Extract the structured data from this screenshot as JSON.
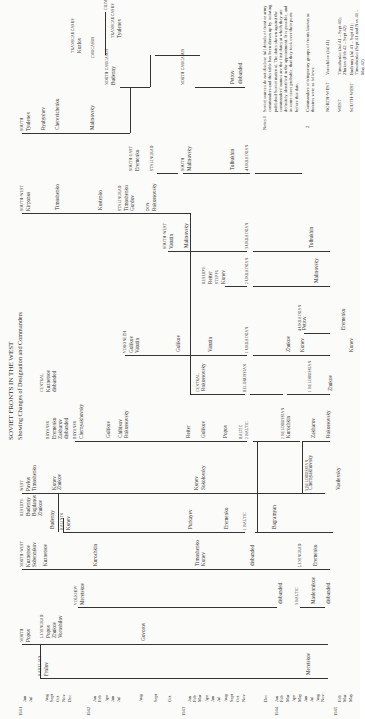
{
  "title": {
    "main": "SOVIET FRONTS IN THE WEST",
    "subtitle": "Showing Changes of Designation and Commanders"
  },
  "axis": {
    "years": [
      {
        "label": "1941",
        "x": 22
      },
      {
        "label": "1942",
        "x": 90
      },
      {
        "label": "1943",
        "x": 185
      },
      {
        "label": "1944",
        "x": 278
      },
      {
        "label": "1945",
        "x": 337
      }
    ],
    "months": [
      {
        "label": "Jun",
        "x": 25
      },
      {
        "label": "Jul",
        "x": 31
      },
      {
        "label": "Aug",
        "x": 47
      },
      {
        "label": "Sept",
        "x": 52
      },
      {
        "label": "Oct",
        "x": 58
      },
      {
        "label": "Nov",
        "x": 64
      },
      {
        "label": "Dec",
        "x": 70
      },
      {
        "label": "Jan",
        "x": 95
      },
      {
        "label": "Feb",
        "x": 100
      },
      {
        "label": "Apr",
        "x": 107
      },
      {
        "label": "Jun",
        "x": 113
      },
      {
        "label": "Jul",
        "x": 119
      },
      {
        "label": "Aug",
        "x": 141
      },
      {
        "label": "Sept",
        "x": 156
      },
      {
        "label": "Oct",
        "x": 170
      },
      {
        "label": "Jan",
        "x": 190
      },
      {
        "label": "Feb",
        "x": 195
      },
      {
        "label": "Mar",
        "x": 200
      },
      {
        "label": "Apr",
        "x": 207
      },
      {
        "label": "Jun",
        "x": 213
      },
      {
        "label": "Jul",
        "x": 219
      },
      {
        "label": "Aug",
        "x": 226
      },
      {
        "label": "Sept",
        "x": 232
      },
      {
        "label": "Oct",
        "x": 238
      },
      {
        "label": "Nov",
        "x": 244
      },
      {
        "label": "Dec",
        "x": 266
      },
      {
        "label": "Jan",
        "x": 277
      },
      {
        "label": "Feb",
        "x": 282
      },
      {
        "label": "Mar",
        "x": 288
      },
      {
        "label": "Apr",
        "x": 294
      },
      {
        "label": "May",
        "x": 300
      },
      {
        "label": "Jun",
        "x": 306
      },
      {
        "label": "Jul",
        "x": 312
      },
      {
        "label": "Aug",
        "x": 318
      },
      {
        "label": "Nov",
        "x": 323
      },
      {
        "label": "Feb",
        "x": 340
      },
      {
        "label": "Mar",
        "x": 345
      },
      {
        "label": "May",
        "x": 351
      }
    ]
  },
  "fronts": [
    {
      "name": "NORTH",
      "x": 22,
      "y": 644,
      "commanders": [
        "Popov"
      ]
    },
    {
      "name": "KARELIAN",
      "x": 40,
      "y": 678,
      "commanders": [
        "Frolov"
      ]
    },
    {
      "name": "LENINGRAD",
      "x": 42,
      "y": 640,
      "commanders": [
        "Popov",
        "Zhukov",
        "Voroshilov"
      ]
    },
    {
      "name": "VOLKHOV",
      "x": 76,
      "y": 607,
      "commanders": [
        "Meretskov"
      ]
    },
    {
      "name": "NORTH-WEST",
      "x": 22,
      "y": 569,
      "commanders": [
        "Kuznetsov",
        "Sobennikov"
      ]
    },
    {
      "name": "RESERVE",
      "x": 22,
      "y": 518,
      "commanders": [
        "Budenny",
        "Bogdanov",
        "Zhukov"
      ]
    },
    {
      "name": "KALININ",
      "x": 62,
      "y": 532,
      "commanders": [
        "Konev"
      ]
    },
    {
      "name": "WEST",
      "x": 22,
      "y": 493,
      "commanders": [
        "Pavlov",
        "Timoshenko"
      ]
    },
    {
      "name": "BRYANSK",
      "x": 48,
      "y": 441,
      "commanders": [
        "Eremenko",
        "Zakharov",
        "disbanded"
      ]
    },
    {
      "name": "BRYANSK",
      "x": 75,
      "y": 441,
      "commanders": [
        "Chernyakhovsky"
      ]
    },
    {
      "name": "CENTRAL",
      "x": 42,
      "y": 394,
      "commanders": [
        "Kuznetsov",
        "disbanded"
      ]
    },
    {
      "name": "VORONEZH",
      "x": 125,
      "y": 355,
      "commanders": [
        "Golikov",
        "Vatutin"
      ]
    },
    {
      "name": "SOUTH-WEST",
      "x": 22,
      "y": 213,
      "commanders": [
        "Kirponos"
      ]
    },
    {
      "name": "STALINGRAD",
      "x": 120,
      "y": 213,
      "commanders": [
        "Timoshenko",
        "Gordov"
      ]
    },
    {
      "name": "DON",
      "x": 148,
      "y": 213,
      "commanders": [
        "Rokossovsky"
      ]
    },
    {
      "name": "SOUTH-WEST",
      "x": 165,
      "y": 251,
      "commanders": [
        "Vatutin"
      ]
    },
    {
      "name": "RESERVE",
      "x": 204,
      "y": 286,
      "commanders": [
        "Reiter"
      ]
    },
    {
      "name": "STEPPE",
      "x": 217,
      "y": 286,
      "commanders": [
        "Konev"
      ]
    },
    {
      "name": "SOUTH",
      "x": 22,
      "y": 133,
      "commanders": [
        "Tyulenev"
      ]
    },
    {
      "name": "SOUTH-EAST",
      "x": 131,
      "y": 173,
      "commanders": [
        "Eremenko"
      ]
    },
    {
      "name": "STALINGRAD",
      "x": 152,
      "y": 173,
      "commanders": []
    },
    {
      "name": "SOUTH",
      "x": 183,
      "y": 173,
      "commanders": [
        "Malinovsky"
      ]
    },
    {
      "name": "NORTH CAUCASUS",
      "x": 107,
      "y": 87,
      "commanders": [
        "Budenny"
      ]
    },
    {
      "name": "TRANSCAUCASUS",
      "x": 73,
      "y": 55,
      "commanders": [
        "Kozlov"
      ]
    },
    {
      "name": "CAUCASUS",
      "x": 93,
      "y": 60,
      "commanders": []
    },
    {
      "name": "TRANSCAUCASUS",
      "x": 113,
      "y": 40,
      "commanders": [
        "Tyulenev"
      ]
    },
    {
      "name": "CRIMEA",
      "x": 106,
      "y": 12,
      "commanders": []
    },
    {
      "name": "NORTH CAUCASUS",
      "x": 183,
      "y": 87,
      "commanders": []
    }
  ],
  "later_fronts": [
    {
      "name": "BALTIC",
      "x": 241,
      "y": 441
    },
    {
      "name": "2 BALTIC",
      "x": 247,
      "y": 441
    },
    {
      "name": "1 BALTIC",
      "x": 245,
      "y": 532
    },
    {
      "name": "3 BALTIC",
      "x": 297,
      "y": 607
    },
    {
      "name": "2 BELORUSSIAN",
      "x": 283,
      "y": 441
    },
    {
      "name": "3 BELORUSSIAN",
      "x": 307,
      "y": 493
    },
    {
      "name": "1 BELORUSSIAN",
      "x": 310,
      "y": 394
    },
    {
      "name": "BELORUSSIAN",
      "x": 245,
      "y": 394
    },
    {
      "name": "1 UKRAINIAN",
      "x": 247,
      "y": 355
    },
    {
      "name": "2 UKRAINIAN",
      "x": 247,
      "y": 286
    },
    {
      "name": "3 UKRAINIAN",
      "x": 247,
      "y": 251
    },
    {
      "name": "4 UKRAINIAN",
      "x": 247,
      "y": 173
    },
    {
      "name": "4 UKRAINIAN",
      "x": 300,
      "y": 333
    },
    {
      "name": "LENINGRAD",
      "x": 300,
      "y": 569
    },
    {
      "name": "CENTRAL",
      "x": 198,
      "y": 394
    }
  ],
  "commander_labels": [
    {
      "text": "Kuznetsov",
      "x": 45,
      "y": 569
    },
    {
      "text": "Kurochkin",
      "x": 95,
      "y": 569
    },
    {
      "text": "Timoshenko",
      "x": 197,
      "y": 569
    },
    {
      "text": "Konev",
      "x": 203,
      "y": 569
    },
    {
      "text": "disbanded",
      "x": 252,
      "y": 569
    },
    {
      "text": "Eremenko",
      "x": 315,
      "y": 569
    },
    {
      "text": "disbanded",
      "x": 280,
      "y": 607
    },
    {
      "text": "Maslennikov",
      "x": 313,
      "y": 607
    },
    {
      "text": "disbanded",
      "x": 328,
      "y": 607
    },
    {
      "text": "Govorov",
      "x": 143,
      "y": 644
    },
    {
      "text": "Meretskov",
      "x": 308,
      "y": 678
    },
    {
      "text": "Budenny",
      "x": 52,
      "y": 532
    },
    {
      "text": "Purkayev",
      "x": 190,
      "y": 532
    },
    {
      "text": "Eremenko",
      "x": 226,
      "y": 532
    },
    {
      "text": "Bagramyan",
      "x": 274,
      "y": 532
    },
    {
      "text": "Konev",
      "x": 54,
      "y": 493
    },
    {
      "text": "Zhukov",
      "x": 59,
      "y": 493
    },
    {
      "text": "Konev",
      "x": 196,
      "y": 493
    },
    {
      "text": "Sokolovsky",
      "x": 203,
      "y": 493
    },
    {
      "text": "Chernyakhovsky",
      "x": 310,
      "y": 493
    },
    {
      "text": "Vasilevsky",
      "x": 338,
      "y": 493
    },
    {
      "text": "Golikov",
      "x": 108,
      "y": 441
    },
    {
      "text": "Chibisov",
      "x": 120,
      "y": 441
    },
    {
      "text": "Rokossovsky",
      "x": 126,
      "y": 441
    },
    {
      "text": "Reiter",
      "x": 188,
      "y": 441
    },
    {
      "text": "Golikov",
      "x": 203,
      "y": 441
    },
    {
      "text": "Popov",
      "x": 225,
      "y": 441
    },
    {
      "text": "Kurochkin",
      "x": 288,
      "y": 441
    },
    {
      "text": "Zakharov",
      "x": 313,
      "y": 441
    },
    {
      "text": "Rokossovsky",
      "x": 328,
      "y": 441
    },
    {
      "text": "Rokossovsky",
      "x": 203,
      "y": 394
    },
    {
      "text": "Zhukov",
      "x": 330,
      "y": 394
    },
    {
      "text": "Golikov",
      "x": 178,
      "y": 355
    },
    {
      "text": "Vatutin",
      "x": 210,
      "y": 355
    },
    {
      "text": "Zhukov",
      "x": 288,
      "y": 355
    },
    {
      "text": "Konev",
      "x": 302,
      "y": 355
    },
    {
      "text": "Konev",
      "x": 351,
      "y": 355
    },
    {
      "text": "Petrov",
      "x": 304,
      "y": 333
    },
    {
      "text": "Eremenko",
      "x": 343,
      "y": 333
    },
    {
      "text": "Malinovsky",
      "x": 316,
      "y": 286
    },
    {
      "text": "Malinovsky",
      "x": 186,
      "y": 251
    },
    {
      "text": "Tolbukhin",
      "x": 311,
      "y": 251
    },
    {
      "text": "Timoshenko",
      "x": 57,
      "y": 213
    },
    {
      "text": "Kostenko",
      "x": 100,
      "y": 213
    },
    {
      "text": "Ryabyshev",
      "x": 43,
      "y": 133
    },
    {
      "text": "Cherevichenko",
      "x": 57,
      "y": 133
    },
    {
      "text": "Malinovsky",
      "x": 92,
      "y": 133
    },
    {
      "text": "Tolbukhin",
      "x": 232,
      "y": 173
    },
    {
      "text": "Petrov",
      "x": 232,
      "y": 87
    },
    {
      "text": "disbanded",
      "x": 240,
      "y": 87
    }
  ],
  "lines": [
    {
      "x1": 22,
      "x2": 330,
      "y": 569
    },
    {
      "x1": 78,
      "x2": 277,
      "y": 607
    },
    {
      "x1": 300,
      "x2": 325,
      "y": 607
    },
    {
      "x1": 22,
      "x2": 328,
      "y": 644
    },
    {
      "x1": 40,
      "x2": 328,
      "y": 678
    },
    {
      "x1": 63,
      "x2": 245,
      "y": 532
    },
    {
      "x1": 255,
      "x2": 333,
      "y": 532
    },
    {
      "x1": 22,
      "x2": 325,
      "y": 493
    },
    {
      "x1": 75,
      "x2": 247,
      "y": 441
    },
    {
      "x1": 253,
      "x2": 300,
      "y": 441
    },
    {
      "x1": 303,
      "x2": 330,
      "y": 441
    },
    {
      "x1": 190,
      "x2": 245,
      "y": 394
    },
    {
      "x1": 250,
      "x2": 283,
      "y": 394
    },
    {
      "x1": 287,
      "x2": 330,
      "y": 394
    },
    {
      "x1": 125,
      "x2": 247,
      "y": 355
    },
    {
      "x1": 253,
      "x2": 330,
      "y": 355
    },
    {
      "x1": 304,
      "x2": 330,
      "y": 333
    },
    {
      "x1": 225,
      "x2": 247,
      "y": 286
    },
    {
      "x1": 253,
      "x2": 330,
      "y": 286
    },
    {
      "x1": 168,
      "x2": 247,
      "y": 251
    },
    {
      "x1": 253,
      "x2": 330,
      "y": 251
    },
    {
      "x1": 22,
      "x2": 190,
      "y": 213
    },
    {
      "x1": 22,
      "x2": 130,
      "y": 133
    },
    {
      "x1": 120,
      "x2": 150,
      "y": 87
    },
    {
      "x1": 155,
      "x2": 185,
      "y": 55
    },
    {
      "x1": 155,
      "x2": 200,
      "y": 55
    },
    {
      "x1": 195,
      "x2": 245,
      "y": 87
    },
    {
      "x1": 157,
      "x2": 178,
      "y": 173
    },
    {
      "x1": 183,
      "x2": 250,
      "y": 173
    },
    {
      "x1": 255,
      "x2": 302,
      "y": 173
    }
  ],
  "vlines": [
    {
      "x": 40,
      "y1": 644,
      "y2": 678
    },
    {
      "x": 58,
      "y1": 493,
      "y2": 532
    },
    {
      "x": 63,
      "y1": 518,
      "y2": 532
    },
    {
      "x": 190,
      "y1": 213,
      "y2": 394
    },
    {
      "x": 257,
      "y1": 441,
      "y2": 532
    },
    {
      "x": 130,
      "y1": 87,
      "y2": 133
    },
    {
      "x": 150,
      "y1": 55,
      "y2": 87
    },
    {
      "x": 302,
      "y1": 441,
      "y2": 493
    },
    {
      "x": 105,
      "y1": 12,
      "y2": 55
    }
  ],
  "notes": {
    "label": "Notes 1",
    "paragraph": "Soviet sources do not disclose full details of front or army commanders and this table has been drawn up by isolating published Soviet material. The dates shown against the commanders' names are the first dates at which they are definitely identified in the appointment. It is possible, and in some cases probable, that they took over their posts before this date.",
    "item2_label": "2",
    "item2": "Commanders of temporary groups of fronts known as theatres were as follows:",
    "theatres": [
      {
        "name": "NORTH-WEST",
        "detail": "Voroshilov (Jul 41)"
      },
      {
        "name": "WEST",
        "detail": "Timoshenko (Jul 41 – Sept 41); Zhukov (Feb 42 – Sept 42)"
      },
      {
        "name": "SOUTH-WEST",
        "detail": "Budenny (Jul 41 – Sept 41); Timoshenko (Sept 41 and Nov 41 – May 42)"
      }
    ]
  }
}
